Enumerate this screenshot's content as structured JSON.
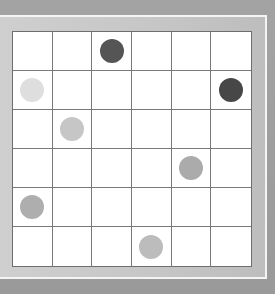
{
  "board": {
    "rows": 6,
    "cols": 6,
    "pieces": [
      {
        "row": 0,
        "col": 2,
        "shade": "dark",
        "color": "#555555"
      },
      {
        "row": 1,
        "col": 0,
        "shade": "very-light",
        "color": "#dedede"
      },
      {
        "row": 1,
        "col": 5,
        "shade": "dark",
        "color": "#474747"
      },
      {
        "row": 2,
        "col": 1,
        "shade": "light",
        "color": "#c6c6c6"
      },
      {
        "row": 3,
        "col": 4,
        "shade": "medium",
        "color": "#ababab"
      },
      {
        "row": 4,
        "col": 0,
        "shade": "medium",
        "color": "#aeaeae"
      },
      {
        "row": 5,
        "col": 3,
        "shade": "light",
        "color": "#bcbcbc"
      }
    ]
  },
  "colors": {
    "background": "#9c9c9c",
    "frame": "#c8c8c8",
    "frame_highlight": "#f4f4f4",
    "board": "#ffffff",
    "grid_line": "#7a7a7a"
  }
}
